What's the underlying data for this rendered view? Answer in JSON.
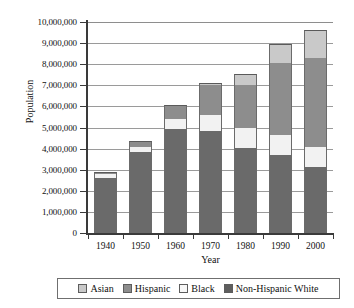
{
  "chart_data": {
    "type": "bar",
    "stacked": true,
    "title": "",
    "xlabel": "Year",
    "ylabel": "Population",
    "categories": [
      "1940",
      "1950",
      "1960",
      "1970",
      "1980",
      "1990",
      "2000"
    ],
    "ylim": [
      0,
      10000000
    ],
    "ytick_values": [
      0,
      1000000,
      2000000,
      3000000,
      4000000,
      5000000,
      6000000,
      7000000,
      8000000,
      9000000,
      10000000
    ],
    "ytick_labels": [
      "0",
      "1,000,000",
      "2,000,000",
      "3,000,000",
      "4,000,000",
      "5,000,000",
      "6,000,000",
      "7,000,000",
      "8,000,000",
      "9,000,000",
      "10,000,000"
    ],
    "grid": true,
    "grid_axis": "y",
    "legend_position": "bottom",
    "series": [
      {
        "name": "Non-Hispanic White",
        "color": "#6a6a6a",
        "values": [
          2630000,
          3830000,
          4910000,
          4840000,
          4030000,
          3700000,
          3110000
        ]
      },
      {
        "name": "Black",
        "color": "#f2f2f2",
        "values": [
          170000,
          250000,
          480000,
          740000,
          930000,
          950000,
          950000
        ]
      },
      {
        "name": "Hispanic",
        "color": "#8d8d8d",
        "values": [
          30000,
          220000,
          610000,
          1440000,
          2050000,
          3400000,
          4250000
        ]
      },
      {
        "name": "Asian",
        "color": "#c9c9c9",
        "values": [
          20000,
          30000,
          60000,
          70000,
          540000,
          920000,
          1300000
        ]
      }
    ],
    "totals": [
      2850000,
      4330000,
      6060000,
      7090000,
      7550000,
      8970000,
      9610000
    ]
  },
  "legend": {
    "entries": [
      {
        "label": "Asian",
        "color": "#c9c9c9"
      },
      {
        "label": "Hispanic",
        "color": "#8d8d8d"
      },
      {
        "label": "Black",
        "color": "#f7f7f7"
      },
      {
        "label": "Non-Hispanic White",
        "color": "#5e5e5e"
      }
    ]
  }
}
